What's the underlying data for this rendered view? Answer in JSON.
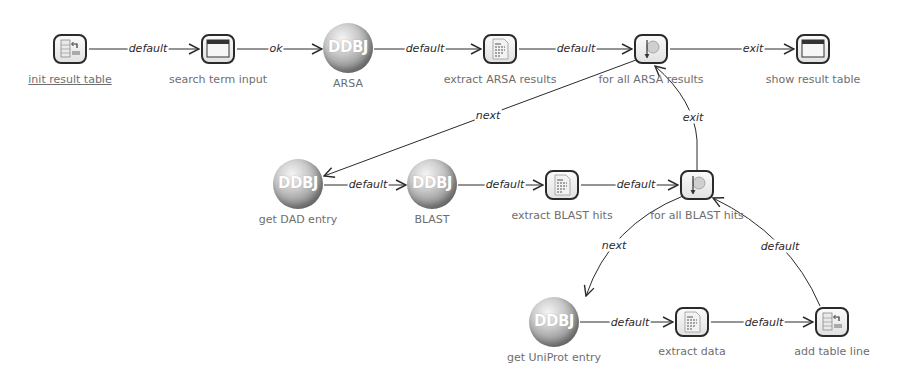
{
  "diagram": {
    "nodes": [
      {
        "id": "init",
        "label": "init result table",
        "type": "table-icon",
        "x": 70,
        "y": 49,
        "underline": true
      },
      {
        "id": "search",
        "label": "search term input",
        "type": "window-icon",
        "x": 218,
        "y": 49
      },
      {
        "id": "arsa",
        "label": "ARSA",
        "type": "ddbj",
        "x": 348,
        "y": 48
      },
      {
        "id": "extract_arsa",
        "label": "extract ARSA results",
        "type": "document-icon",
        "x": 500,
        "y": 49
      },
      {
        "id": "forall_arsa",
        "label": "for all ARSA results",
        "type": "loop-icon",
        "x": 651,
        "y": 49
      },
      {
        "id": "show",
        "label": "show result table",
        "type": "window-icon",
        "x": 813,
        "y": 49
      },
      {
        "id": "dad",
        "label": "get DAD entry",
        "type": "ddbj",
        "x": 298,
        "y": 184
      },
      {
        "id": "blast",
        "label": "BLAST",
        "type": "ddbj",
        "x": 432,
        "y": 184
      },
      {
        "id": "extract_blast",
        "label": "extract BLAST hits",
        "type": "document-icon",
        "x": 562,
        "y": 185
      },
      {
        "id": "forall_blast",
        "label": "for all BLAST hits",
        "type": "loop-icon",
        "x": 697,
        "y": 185
      },
      {
        "id": "uniprot",
        "label": "get UniProt entry",
        "type": "ddbj",
        "x": 554,
        "y": 322
      },
      {
        "id": "extract_data",
        "label": "extract data",
        "type": "document-icon",
        "x": 692,
        "y": 322
      },
      {
        "id": "add_line",
        "label": "add table line",
        "type": "table-icon",
        "x": 832,
        "y": 322
      }
    ],
    "ddbj_text": "DDBJ",
    "edges": [
      {
        "from": "init",
        "to": "search",
        "label": "default"
      },
      {
        "from": "search",
        "to": "arsa",
        "label": "ok"
      },
      {
        "from": "arsa",
        "to": "extract_arsa",
        "label": "default"
      },
      {
        "from": "extract_arsa",
        "to": "forall_arsa",
        "label": "default"
      },
      {
        "from": "forall_arsa",
        "to": "show",
        "label": "exit"
      },
      {
        "from": "forall_arsa",
        "to": "dad",
        "label": "next"
      },
      {
        "from": "dad",
        "to": "blast",
        "label": "default"
      },
      {
        "from": "blast",
        "to": "extract_blast",
        "label": "default"
      },
      {
        "from": "extract_blast",
        "to": "forall_blast",
        "label": "default"
      },
      {
        "from": "forall_blast",
        "to": "forall_arsa",
        "label": "exit"
      },
      {
        "from": "forall_blast",
        "to": "uniprot",
        "label": "next"
      },
      {
        "from": "uniprot",
        "to": "extract_data",
        "label": "default"
      },
      {
        "from": "extract_data",
        "to": "add_line",
        "label": "default"
      },
      {
        "from": "add_line",
        "to": "forall_blast",
        "label": "default"
      }
    ]
  },
  "colors": {
    "edge": "#2a2a2a",
    "node_label": "#6e6e6e",
    "box_border": "#2a2a2a"
  }
}
